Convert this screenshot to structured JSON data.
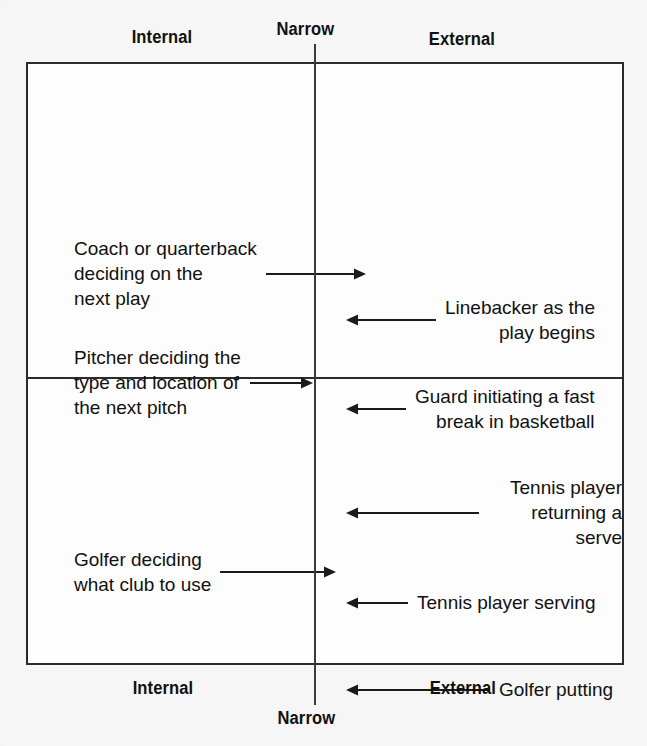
{
  "diagram": {
    "type": "2x2-matrix",
    "axis": {
      "top_left_label": "Internal",
      "top_center_label": "Narrow",
      "top_right_label": "External",
      "bottom_left_label": "Internal",
      "bottom_center_label": "Narrow",
      "bottom_right_label": "External"
    },
    "entries": {
      "coach": "Coach or quarterback\ndeciding on the\nnext play",
      "pitcher": "Pitcher deciding the\ntype and location of\nthe next pitch",
      "golfer_club": "Golfer deciding\nwhat club to use",
      "linebacker": "Linebacker as the\nplay begins",
      "guard": "Guard initiating a fast\nbreak in basketball",
      "tennis_returning": "Tennis player\nreturning a serve",
      "tennis_serving": "Tennis player serving",
      "golfer_putting": "Golfer putting"
    },
    "colors": {
      "ink": "#111111",
      "rule": "#2b2b2b",
      "paper": "#f6f6f6",
      "panel": "#fdfdfd"
    }
  }
}
